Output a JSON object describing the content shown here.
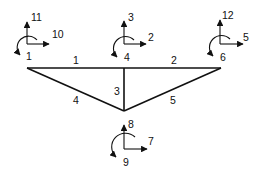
{
  "diagram": {
    "type": "structural-frame-dof-diagram",
    "stroke_color": "#111111",
    "nodes": [
      {
        "id": "left",
        "x": 27,
        "y": 68
      },
      {
        "id": "top",
        "x": 124,
        "y": 68
      },
      {
        "id": "right",
        "x": 221,
        "y": 68
      },
      {
        "id": "bottom",
        "x": 124,
        "y": 111
      }
    ],
    "members": [
      {
        "label": "1",
        "from": "left",
        "to": "top"
      },
      {
        "label": "2",
        "from": "top",
        "to": "right"
      },
      {
        "label": "3",
        "from": "top",
        "to": "bottom"
      },
      {
        "label": "4",
        "from": "left",
        "to": "bottom"
      },
      {
        "label": "5",
        "from": "right",
        "to": "bottom"
      }
    ],
    "dof_groups": [
      {
        "node": "left",
        "horizontal": "10",
        "vertical": "11",
        "rotation": "1"
      },
      {
        "node": "top",
        "horizontal": "2",
        "vertical": "3",
        "rotation": "4"
      },
      {
        "node": "right",
        "horizontal": "5",
        "vertical": "12",
        "rotation": "6"
      },
      {
        "node": "bottom",
        "horizontal": "7",
        "vertical": "8",
        "rotation": "9"
      }
    ]
  }
}
